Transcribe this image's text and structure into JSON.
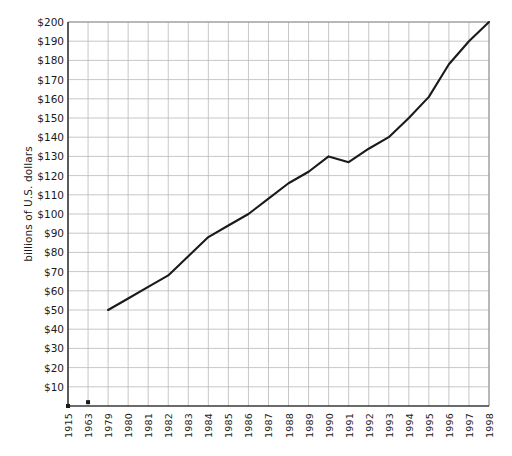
{
  "chart_data": {
    "type": "line",
    "title": "",
    "xlabel": "",
    "ylabel": "billions of U.S. dollars",
    "ylim": [
      0,
      200
    ],
    "ytick_labels": [
      "$200",
      "$190",
      "$180",
      "$170",
      "$160",
      "$150",
      "$140",
      "$130",
      "$120",
      "$110",
      "$100",
      "$90",
      "$80",
      "$70",
      "$60",
      "$50",
      "$40",
      "$30",
      "$20",
      "$10"
    ],
    "ytick_values": [
      200,
      190,
      180,
      170,
      160,
      150,
      140,
      130,
      120,
      110,
      100,
      90,
      80,
      70,
      60,
      50,
      40,
      30,
      20,
      10
    ],
    "categories": [
      "1915",
      "1963",
      "1979",
      "1980",
      "1981",
      "1982",
      "1983",
      "1984",
      "1985",
      "1986",
      "1987",
      "1988",
      "1989",
      "1990",
      "1991",
      "1992",
      "1993",
      "1994",
      "1995",
      "1996",
      "1997",
      "1998"
    ],
    "series": [
      {
        "name": "billions of U.S. dollars",
        "values": [
          null,
          2,
          50,
          56,
          62,
          68,
          78,
          88,
          94,
          100,
          108,
          116,
          122,
          130,
          127,
          134,
          140,
          150,
          161,
          178,
          190,
          200
        ],
        "color": "#1a1a1a"
      }
    ],
    "markers": [
      {
        "category": "1915",
        "value": 0,
        "note": "axis origin point"
      },
      {
        "category": "1963",
        "value": 2,
        "note": "isolated square marker near baseline"
      }
    ],
    "grid": true,
    "grid_color": "#b9b9b9",
    "legend": "none",
    "axis_color": "#3a3a3a",
    "line_start_category": "1979",
    "line_end_category": "1998"
  },
  "meta": {
    "background": "#ffffff"
  }
}
